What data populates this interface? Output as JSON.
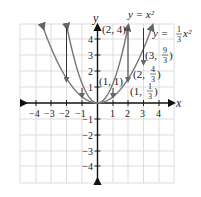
{
  "figure": {
    "x_axis_label": "x",
    "y_axis_label": "y",
    "x_ticks": [
      "−4",
      "−3",
      "−2",
      "−1",
      "1",
      "2",
      "3",
      "4"
    ],
    "y_ticks": [
      "4",
      "3",
      "2",
      "1",
      "−1",
      "−2",
      "−3",
      "−4"
    ],
    "curve_labels": {
      "parabola_1": "y = x²",
      "parabola_2_prefix": "y =",
      "parabola_2_num": "1",
      "parabola_2_den": "3",
      "parabola_2_suffix": "x²"
    },
    "points": [
      {
        "label": "(2, 4)"
      },
      {
        "label": "(1, 1)"
      },
      {
        "label_prefix": "(3,",
        "num": "9",
        "den": "3",
        "suffix": ")"
      },
      {
        "label_prefix": "(2,",
        "num": "4",
        "den": "3",
        "suffix": ")"
      },
      {
        "label_prefix": "(1,",
        "num": "1",
        "den": "3",
        "suffix": ")"
      }
    ],
    "colors": {
      "axis": "#111111",
      "grid": "#d4d4d4",
      "curve": "#777777",
      "arrow": "#333333"
    }
  }
}
